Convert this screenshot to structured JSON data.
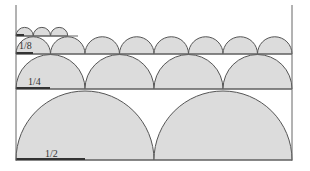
{
  "diagram": {
    "title": "",
    "colors": {
      "fill": "#dcdcdc",
      "stroke": "#555555",
      "axis": "#666666",
      "scale_bar": "#333333",
      "background": "#ffffff"
    },
    "frame": {
      "left_x": 16,
      "right_x": 292,
      "top_y": 5,
      "bottom_y": 161
    },
    "rows": [
      {
        "label": "",
        "scale": "1/16",
        "baseline_y": 36,
        "diameter": 17.25,
        "count": 3,
        "line_end_x": 78,
        "bar_end_x": 24
      },
      {
        "label": "1/8",
        "scale": "1/8",
        "baseline_y": 54,
        "diameter": 34.5,
        "count": 8,
        "line_end_x": 292,
        "bar_end_x": 33,
        "label_x": 19,
        "label_y": 41
      },
      {
        "label": "1/4",
        "scale": "1/4",
        "baseline_y": 89,
        "diameter": 69,
        "count": 4,
        "line_end_x": 292,
        "bar_end_x": 50,
        "label_x": 28,
        "label_y": 77
      },
      {
        "label": "1/2",
        "scale": "1/2",
        "baseline_y": 160,
        "diameter": 138,
        "count": 2,
        "line_end_x": 292,
        "bar_end_x": 85,
        "label_x": 45,
        "label_y": 149
      }
    ]
  }
}
